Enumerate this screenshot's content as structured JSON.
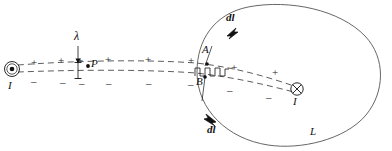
{
  "figure": {
    "type": "physics-diagram",
    "title_visible": false,
    "width": 392,
    "height": 151,
    "background_color": "#ffffff",
    "ink_color": "#111111",
    "curve_color": "#555555"
  },
  "labels": {
    "lambda": "λ",
    "point_p": "P",
    "point_a": "A",
    "point_b": "B",
    "loop_name": "L",
    "current_left": "I",
    "current_right": "I",
    "dl_upper": "dl",
    "dl_lower": "dl"
  },
  "charges": {
    "plus_symbol": "+",
    "minus_symbol": "–",
    "plus_count": 8,
    "minus_count": 8,
    "plus_positions": [
      {
        "x": 31,
        "y": 57
      },
      {
        "x": 58,
        "y": 55
      },
      {
        "x": 77,
        "y": 55
      },
      {
        "x": 105,
        "y": 54
      },
      {
        "x": 145,
        "y": 54
      },
      {
        "x": 188,
        "y": 55
      },
      {
        "x": 231,
        "y": 62
      },
      {
        "x": 272,
        "y": 67
      }
    ],
    "minus_positions": [
      {
        "x": 31,
        "y": 76
      },
      {
        "x": 60,
        "y": 77
      },
      {
        "x": 79,
        "y": 78
      },
      {
        "x": 106,
        "y": 78
      },
      {
        "x": 146,
        "y": 78
      },
      {
        "x": 188,
        "y": 79
      },
      {
        "x": 227,
        "y": 85
      },
      {
        "x": 266,
        "y": 92
      }
    ]
  },
  "symbols": {
    "current_out_of_page": "dot-in-circle",
    "current_into_page": "cross-in-circle",
    "lambda_marker": "tick-with-down-arrow",
    "ab_segment": "square-wave-zigzag"
  },
  "geometry": {
    "loop_center": {
      "x": 290,
      "y": 74
    },
    "loop_rx": 93,
    "loop_ry": 70,
    "wire_left_terminal": {
      "x": 12,
      "y": 70
    },
    "wire_right_terminal": {
      "x": 296,
      "y": 88
    },
    "point_p_dot": {
      "x": 88,
      "y": 65
    },
    "point_a_dot": {
      "x": 206,
      "y": 64
    },
    "point_b_dot": {
      "x": 204,
      "y": 76
    }
  }
}
